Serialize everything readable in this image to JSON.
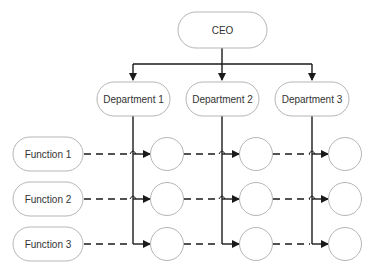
{
  "diagram": {
    "type": "matrix-org-chart",
    "colors": {
      "box_stroke": "#b5b5b5",
      "line": "#1a1a1a",
      "text": "#333333",
      "background": "#ffffff"
    },
    "ceo": {
      "label": "CEO"
    },
    "departments": [
      {
        "label": "Department 1"
      },
      {
        "label": "Department 2"
      },
      {
        "label": "Department 3"
      }
    ],
    "functions": [
      {
        "label": "Function 1"
      },
      {
        "label": "Function 2"
      },
      {
        "label": "Function 3"
      }
    ],
    "edges": {
      "ceo_to_departments": "solid arrows",
      "departments_to_cells": "solid vertical lines with arrows into circles",
      "functions_to_cells": "dashed horizontal arrows into circles"
    }
  }
}
